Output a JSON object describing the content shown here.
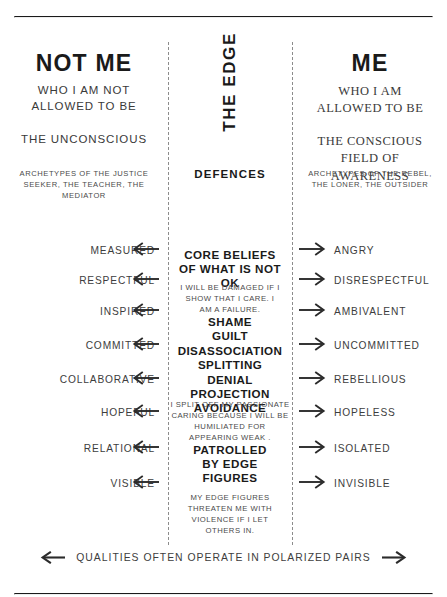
{
  "columns": {
    "left": {
      "title": "NOT ME",
      "subtitle": "WHO I AM NOT\nALLOWED TO BE",
      "field": "THE UNCONSCIOUS",
      "archetypes": "ARCHETYPES OF THE JUSTICE\nSEEKER, THE TEACHER, THE MEDIATOR"
    },
    "center": {
      "title": "THE EDGE",
      "label": "DEFENCES",
      "core_beliefs_heading": "CORE BELIEFS\nOF WHAT IS NOT OK",
      "core_belief_text": "I WILL BE DAMAGED IF I\nSHOW THAT I CARE.  I\nAM A FAILURE.",
      "defence_list": "SHAME\nGUILT\nDISASSOCIATION\nSPLITTING\nDENIAL\nPROJECTION\nAVOIDANCE",
      "split_text": "I SPLIT OFF MY PASSIONATE\nCARING BECAUSE I WILL BE\nHUMILIATED FOR\nAPPEARING WEAK .",
      "patrolled_heading": "PATROLLED\nBY EDGE\nFIGURES",
      "patrolled_text": "MY EDGE FIGURES\nTHREATEN ME WITH\nVIOLENCE IF I LET\nOTHERS IN."
    },
    "right": {
      "title": "ME",
      "subtitle": "WHO I AM\nALLOWED TO BE",
      "field": "THE CONSCIOUS\nFIELD OF\nAWARENESS",
      "archetypes": "ARCHETYPES OF THE REBEL,\nTHE LONER, THE OUTSIDER"
    }
  },
  "qualities": [
    {
      "left": "MEASURED",
      "right": "ANGRY"
    },
    {
      "left": "RESPECTFUL",
      "right": "DISRESPECTFUL"
    },
    {
      "left": "INSPIRED",
      "right": "AMBIVALENT"
    },
    {
      "left": "COMMITTED",
      "right": "UNCOMMITTED"
    },
    {
      "left": "COLLABORATIVE",
      "right": "REBELLIOUS"
    },
    {
      "left": "HOPEFUL",
      "right": "HOPELESS"
    },
    {
      "left": "RELATIONAL",
      "right": "ISOLATED"
    },
    {
      "left": "VISIBLE",
      "right": "INVISIBLE"
    }
  ],
  "footer": {
    "text": "QUALITIES OFTEN OPERATE IN POLARIZED PAIRS"
  },
  "colors": {
    "ink": "#1a1a1a",
    "body": "#3d3d3d",
    "muted": "#4a4a4a",
    "dash": "#8c8c8c",
    "background": "#ffffff"
  }
}
